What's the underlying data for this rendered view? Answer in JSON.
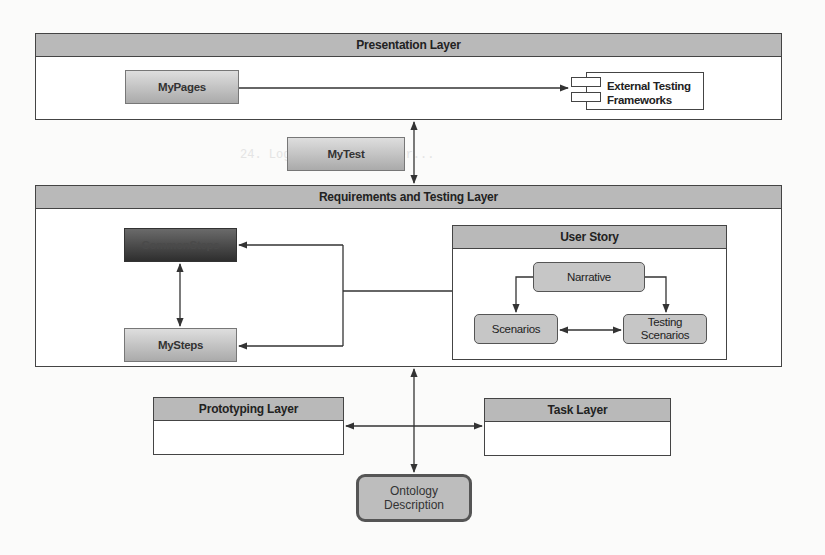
{
  "diagram": {
    "layers": {
      "presentation": {
        "title": "Presentation Layer"
      },
      "requirements": {
        "title": "Requirements and Testing Layer"
      },
      "prototyping": {
        "title": "Prototyping Layer"
      },
      "task": {
        "title": "Task Layer"
      }
    },
    "nodes": {
      "my_pages": "MyPages",
      "external_frameworks_line1": "External Testing",
      "external_frameworks_line2": "Frameworks",
      "my_test": "MyTest",
      "common_steps": "CommonSteps",
      "my_steps": "MySteps",
      "user_story": "User Story",
      "narrative": "Narrative",
      "scenarios": "Scenarios",
      "testing_scenarios_line1": "Testing",
      "testing_scenarios_line2": "Scenarios",
      "ontology_line1": "Ontology",
      "ontology_line2": "Description"
    },
    "edges": [
      {
        "from": "MyPages",
        "to": "External Testing Frameworks",
        "type": "directed"
      },
      {
        "from": "Presentation Layer",
        "to": "Requirements and Testing Layer",
        "type": "bidirectional"
      },
      {
        "from": "User Story",
        "to": "CommonSteps",
        "type": "directed"
      },
      {
        "from": "User Story",
        "to": "MySteps",
        "type": "directed"
      },
      {
        "from": "CommonSteps",
        "to": "MySteps",
        "type": "bidirectional"
      },
      {
        "from": "Narrative",
        "to": "Scenarios",
        "type": "directed"
      },
      {
        "from": "Narrative",
        "to": "Testing Scenarios",
        "type": "directed"
      },
      {
        "from": "Scenarios",
        "to": "Testing Scenarios",
        "type": "bidirectional"
      },
      {
        "from": "Requirements and Testing Layer",
        "to": "Ontology Description",
        "type": "bidirectional"
      },
      {
        "from": "center connector",
        "to": "Prototyping Layer",
        "type": "directed"
      },
      {
        "from": "center connector",
        "to": "Task Layer",
        "type": "directed"
      }
    ]
  }
}
